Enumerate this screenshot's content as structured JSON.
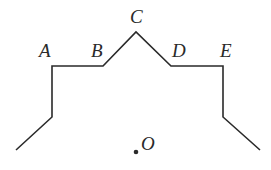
{
  "diagram": {
    "type": "geometric-figure",
    "stroke_color": "#2a2a2a",
    "background": "#ffffff",
    "path_points": [
      [
        16,
        150
      ],
      [
        52,
        117
      ],
      [
        52,
        66
      ],
      [
        103,
        66
      ],
      [
        136,
        32
      ],
      [
        171,
        66
      ],
      [
        223,
        66
      ],
      [
        223,
        117
      ],
      [
        260,
        150
      ]
    ],
    "labels": {
      "A": "A",
      "B": "B",
      "C": "C",
      "D": "D",
      "E": "E",
      "O": "O"
    },
    "label_positions": {
      "A": [
        39,
        57
      ],
      "B": [
        91,
        57
      ],
      "C": [
        130,
        23
      ],
      "D": [
        172,
        57
      ],
      "E": [
        220,
        57
      ],
      "O": [
        141,
        150
      ]
    },
    "center_point": {
      "name": "O",
      "x": 136,
      "y": 152
    }
  }
}
